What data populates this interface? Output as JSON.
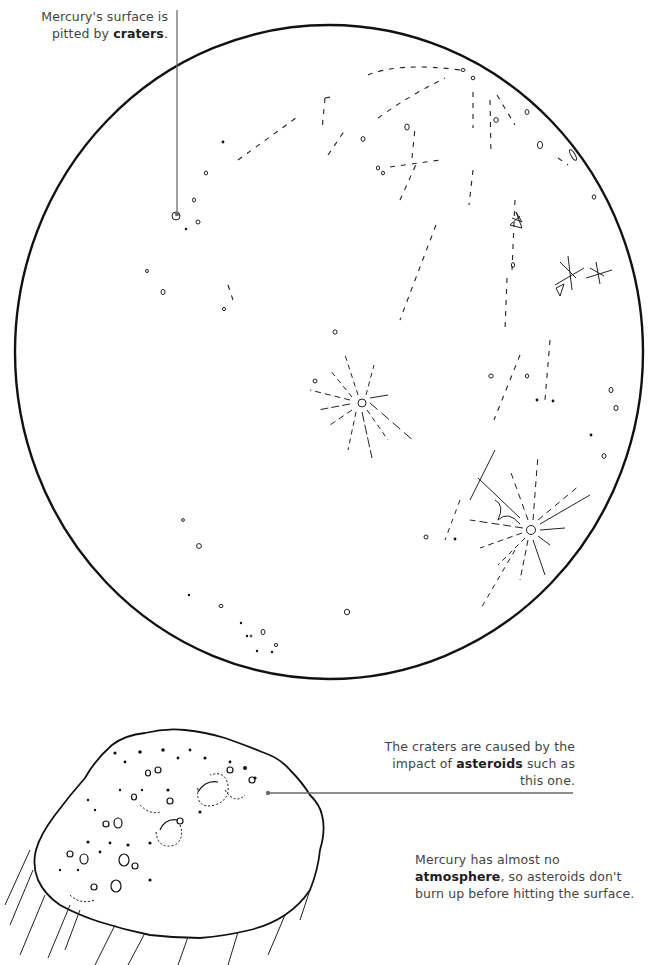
{
  "illustration": {
    "subject": "Mercury",
    "planet_label": "mercury-planet",
    "asteroid_label": "asteroid"
  },
  "captions": {
    "craters": {
      "pre": "Mercury's surface is pitted by ",
      "bold": "craters",
      "post": "."
    },
    "asteroids": {
      "pre": "The craters are caused by the impact of ",
      "bold": "asteroids",
      "post": " such as this one."
    },
    "atmosphere": {
      "pre": "Mercury has almost no ",
      "bold": "atmosphere",
      "post": ", so asteroids don't burn up before hitting the surface."
    }
  },
  "colors": {
    "ink": "#111111",
    "leader_line": "#6b6b6b",
    "text": "#444444",
    "bold_text": "#1d1d1d"
  }
}
